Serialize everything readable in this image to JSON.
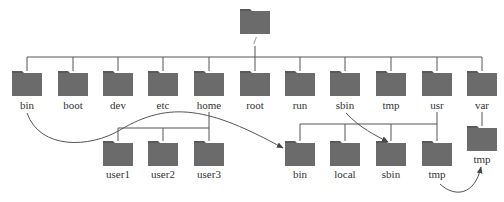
{
  "diagram": {
    "colors": {
      "folder": "#6b6b6b",
      "folder_tab": "#5a5a5a",
      "line": "#555555",
      "text": "#333333"
    },
    "root": {
      "label": "/"
    },
    "level1": [
      {
        "label": "bin"
      },
      {
        "label": "boot"
      },
      {
        "label": "dev"
      },
      {
        "label": "etc"
      },
      {
        "label": "home"
      },
      {
        "label": "root"
      },
      {
        "label": "run"
      },
      {
        "label": "sbin"
      },
      {
        "label": "tmp"
      },
      {
        "label": "usr"
      },
      {
        "label": "var"
      }
    ],
    "home_children": [
      {
        "label": "user1"
      },
      {
        "label": "user2"
      },
      {
        "label": "user3"
      }
    ],
    "usr_children": [
      {
        "label": "bin"
      },
      {
        "label": "local"
      },
      {
        "label": "sbin"
      },
      {
        "label": "tmp"
      }
    ],
    "var_children": [
      {
        "label": "tmp"
      }
    ],
    "links": [
      {
        "from": "/bin",
        "to": "/usr/bin"
      },
      {
        "from": "/sbin",
        "to": "/usr/sbin"
      },
      {
        "from": "/usr/tmp",
        "to": "/var/tmp"
      }
    ]
  }
}
